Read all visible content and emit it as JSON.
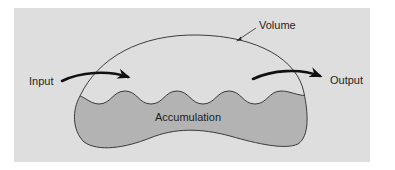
{
  "diagram": {
    "labels": {
      "input": "Input",
      "output": "Output",
      "volume": "Volume",
      "accumulation": "Accumulation"
    },
    "colors": {
      "panel_background": "#dedede",
      "accumulation_fill": "#b3b3b3",
      "outline": "#2a2a2a",
      "arrow": "#111111",
      "text": "#1e1e1e"
    },
    "elements": [
      {
        "id": "control-volume",
        "kind": "closed-outline",
        "label_ref": "volume"
      },
      {
        "id": "accumulation-region",
        "kind": "filled-region-with-wavy-surface",
        "label_ref": "accumulation"
      },
      {
        "id": "input-arrow",
        "kind": "curved-arrow",
        "direction": "into volume",
        "label_ref": "input"
      },
      {
        "id": "output-arrow",
        "kind": "curved-arrow",
        "direction": "out of volume",
        "label_ref": "output"
      }
    ]
  }
}
